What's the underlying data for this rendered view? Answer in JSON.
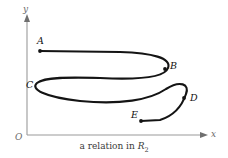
{
  "figure": {
    "caption_prefix": "a relation in",
    "relation_symbol": "R",
    "relation_subscript": "2",
    "curve_color": "#141414",
    "axis_color": "#9a9a9a",
    "background": "#ffffff"
  },
  "axes": {
    "y_label": "y",
    "x_label": "x",
    "origin_label": "O"
  },
  "points": [
    {
      "id": "A",
      "label": "A",
      "x": 40,
      "y": 51,
      "label_x": 37,
      "label_y": 36,
      "marker": true
    },
    {
      "id": "B",
      "label": "B",
      "x": 165,
      "y": 69,
      "label_x": 170,
      "label_y": 61,
      "marker": true
    },
    {
      "id": "C",
      "label": "C",
      "x": 36,
      "y": 85,
      "label_x": 26,
      "label_y": 80,
      "marker": false
    },
    {
      "id": "D",
      "label": "D",
      "x": 184,
      "y": 98,
      "label_x": 190,
      "label_y": 93,
      "marker": true
    },
    {
      "id": "E",
      "label": "E",
      "x": 141,
      "y": 121,
      "label_x": 131,
      "label_y": 110,
      "marker": true
    }
  ],
  "chart_data": {
    "type": "line",
    "title": "a relation in R2",
    "xlabel": "x",
    "ylabel": "y",
    "grid": false,
    "legend": null,
    "curve_path": "M40,51 L120,52 C152,53 172,58 168,68 C165,77 140,80 100,78 C70,77 44,77 37,83 C30,89 44,97 80,101 C120,105 150,100 166,89 C180,80 190,84 186,94 C183,103 176,115 160,120 L141,121",
    "endpoints": [
      "A",
      "E"
    ],
    "marked_points": [
      "A",
      "B",
      "D",
      "E"
    ],
    "axis_origin": {
      "x": 27,
      "y": 135
    }
  }
}
